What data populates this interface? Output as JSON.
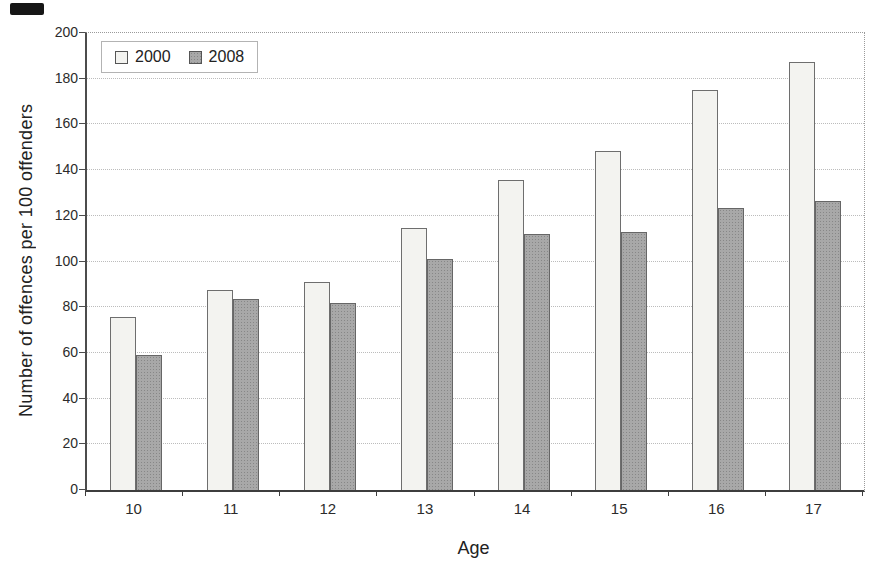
{
  "chart_data": {
    "type": "bar",
    "title": "",
    "categories": [
      "10",
      "11",
      "12",
      "13",
      "14",
      "15",
      "16",
      "17"
    ],
    "series": [
      {
        "name": "2000",
        "values": [
          75.5,
          87.5,
          91,
          114.5,
          135.5,
          148.5,
          175,
          187.5
        ],
        "color": "#f3f3f0",
        "border": "#6e6e6e"
      },
      {
        "name": "2008",
        "values": [
          59,
          83.5,
          82,
          101,
          112,
          113,
          123.5,
          126.5
        ],
        "color": "#a8a8a8",
        "border": "#666666"
      }
    ],
    "xlabel": "Age",
    "ylabel": "Number of offences per 100 offenders",
    "ylim": [
      0,
      200
    ],
    "ytick_step": 20,
    "yticks": [
      "0",
      "20",
      "40",
      "60",
      "80",
      "100",
      "120",
      "140",
      "160",
      "180",
      "200"
    ],
    "grid": "horizontal-dotted",
    "legend_position": "top-left-inside",
    "legend_entries": [
      "2000",
      "2008"
    ]
  }
}
